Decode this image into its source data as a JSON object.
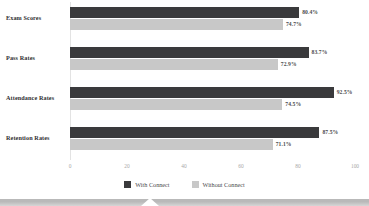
{
  "chart_data": {
    "type": "bar",
    "orientation": "horizontal",
    "title": "",
    "xlabel": "",
    "ylabel": "",
    "xlim": [
      0,
      100
    ],
    "xticks": [
      "0",
      "20",
      "40",
      "60",
      "80",
      "100"
    ],
    "grid": false,
    "legend_position": "bottom-center",
    "categories": [
      "Exam Scores",
      "Pass Rates",
      "Attendance Rates",
      "Retention Rates"
    ],
    "series": [
      {
        "name": "With Connect",
        "color": "#3a3a3c",
        "values": [
          80.4,
          83.7,
          92.5,
          87.5
        ],
        "labels": [
          "80.4%",
          "83.7%",
          "92.5%",
          "87.5%"
        ]
      },
      {
        "name": "Without Connect",
        "color": "#c8c8c8",
        "values": [
          74.7,
          72.9,
          74.5,
          71.1
        ],
        "labels": [
          "74.7%",
          "72.9%",
          "74.5%",
          "71.1%"
        ]
      }
    ]
  },
  "legend": {
    "items": [
      {
        "label": "With Connect",
        "color": "#3a3a3c"
      },
      {
        "label": "Without Connect",
        "color": "#c8c8c8"
      }
    ]
  },
  "axis": {
    "ticks": [
      {
        "label": "0",
        "value": 0
      },
      {
        "label": "20",
        "value": 20
      },
      {
        "label": "40",
        "value": 40
      },
      {
        "label": "60",
        "value": 60
      },
      {
        "label": "80",
        "value": 80
      },
      {
        "label": "100",
        "value": 100
      }
    ]
  },
  "footer_band": {
    "color": "#b9b9b9",
    "notch": "chevron-up-notch"
  }
}
